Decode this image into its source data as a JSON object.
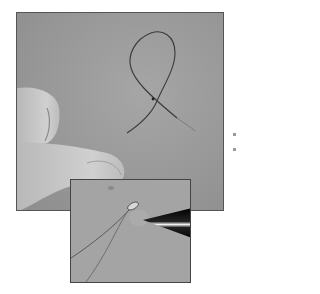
{
  "figure": {
    "main_photo": {
      "subject": "wire-loop-held-by-fingers",
      "tone": "grayscale"
    },
    "inset_photo": {
      "subject": "wire-tip-with-tweezers",
      "tone": "grayscale"
    },
    "colors": {
      "background": "#9c9c9c",
      "skin": "#c8c8c8",
      "wire": "#3a3a3a",
      "tweezers": "#111111"
    }
  }
}
